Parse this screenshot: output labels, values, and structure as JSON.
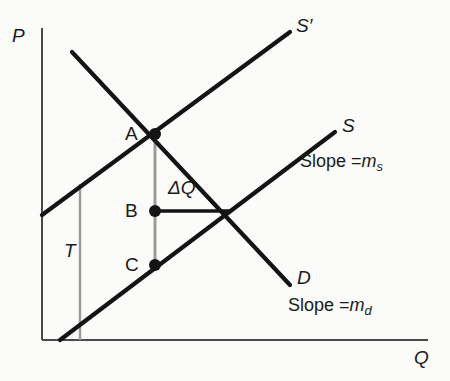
{
  "figure": {
    "type": "supply-demand-tax-diagram",
    "background_color": "#fbfbfa",
    "line_color": "#141414",
    "axis_color": "#4a4a4a",
    "guide_color": "#9a9a9a"
  },
  "axes": {
    "y_label": "P",
    "x_label": "Q",
    "origin": [
      42,
      340
    ],
    "y_top": [
      42,
      28
    ],
    "x_right": [
      428,
      340
    ]
  },
  "curves": [
    {
      "id": "supply-shifted",
      "label": "S′",
      "from": [
        42,
        215
      ],
      "to": [
        290,
        32
      ],
      "label_pos": [
        296,
        16
      ]
    },
    {
      "id": "supply",
      "label": "S",
      "from": [
        60,
        340
      ],
      "to": [
        335,
        132
      ],
      "label_pos": [
        342,
        116
      ],
      "slope_text": "Slope =",
      "slope_symbol": "m",
      "slope_subscript": "s",
      "slope_pos": [
        338,
        152
      ]
    },
    {
      "id": "demand",
      "label": "D",
      "from": [
        72,
        52
      ],
      "to": [
        290,
        285
      ],
      "label_pos": [
        297,
        268
      ],
      "slope_text": "Slope =",
      "slope_symbol": "m",
      "slope_subscript": "d",
      "slope_pos": [
        291,
        296
      ]
    }
  ],
  "points": [
    {
      "id": "A",
      "label": "A",
      "at": [
        155,
        134
      ],
      "label_pos": [
        125,
        124
      ]
    },
    {
      "id": "B",
      "label": "B",
      "at": [
        155,
        211
      ],
      "label_pos": [
        125,
        201
      ]
    },
    {
      "id": "C",
      "label": "C",
      "at": [
        155,
        265
      ],
      "label_pos": [
        125,
        255
      ]
    },
    {
      "id": "E",
      "label": "",
      "at": [
        228,
        211
      ],
      "label_pos": [
        228,
        211
      ]
    }
  ],
  "annotations": {
    "delta_q": {
      "label": "ΔQ",
      "pos": [
        170,
        180
      ],
      "segment_from": [
        155,
        211
      ],
      "segment_to": [
        228,
        211
      ]
    },
    "tax": {
      "label": "T",
      "pos": [
        68,
        243
      ],
      "guide_from": [
        80,
        184
      ],
      "guide_to": [
        80,
        340
      ]
    },
    "vertical_guide": {
      "from": [
        155,
        134
      ],
      "to": [
        155,
        270
      ]
    }
  }
}
